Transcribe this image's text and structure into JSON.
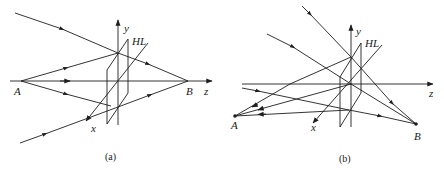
{
  "figure": {
    "panels": [
      {
        "id": "a",
        "caption": "(a)",
        "labels": {
          "point_a": "A",
          "point_b": "B",
          "axis_x": "x",
          "axis_y": "y",
          "axis_z": "z",
          "lens": "HL"
        }
      },
      {
        "id": "b",
        "caption": "(b)",
        "labels": {
          "point_a": "A",
          "point_b": "B",
          "axis_x": "x",
          "axis_y": "y",
          "axis_z": "z",
          "lens": "HL"
        }
      }
    ],
    "colors": {
      "line": "#1e1e1e",
      "background": "#ffffff"
    }
  }
}
